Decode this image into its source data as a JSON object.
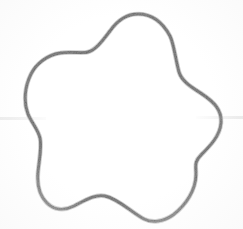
{
  "image": {
    "title": "Rounded five-pointed star outline",
    "description": "Scanned line drawing of a closed rounded star / flower-like blob outline",
    "width": 243,
    "height": 229,
    "background_color": "#ffffff",
    "stroke_color": "#8a8a8a",
    "stroke_color_light": "#a8a8a8",
    "stroke_width": 3
  },
  "shape": {
    "name": "rounded-star",
    "points": 5,
    "closed": true,
    "fill": "none",
    "center": {
      "x": 126,
      "y": 118
    },
    "outer_vertices": [
      {
        "label": "top",
        "x": 138,
        "y": 14
      },
      {
        "label": "right",
        "x": 222,
        "y": 108
      },
      {
        "label": "bottom-right",
        "x": 158,
        "y": 222
      },
      {
        "label": "bottom-left",
        "x": 57,
        "y": 205
      },
      {
        "label": "upper-left",
        "x": 39,
        "y": 57
      }
    ],
    "inner_vertices": [
      {
        "label": "upper-right-notch",
        "x": 179,
        "y": 72
      },
      {
        "label": "right-notch",
        "x": 196,
        "y": 172
      },
      {
        "label": "bottom-notch",
        "x": 105,
        "y": 196
      },
      {
        "label": "left-notch",
        "x": 38,
        "y": 131
      },
      {
        "label": "upper-left-notch",
        "x": 88,
        "y": 52
      }
    ],
    "path": "M 138 14 C 152 14 163 23 170 36 C 174 44 176 62 179 72 C 182 82 193 88 202 94 C 214 102 222 110 221 123 C 220 136 210 146 201 155 C 194 162 196 166 196 174 C 196 190 186 205 173 215 C 163 222 152 223 144 219 C 132 213 119 199 105 196 C 94 194 84 201 74 206 C 64 211 54 210 47 203 C 39 195 37 183 38 172 C 39 161 42 147 40 138 C 38 129 31 122 28 114 C 23 101 25 86 31 74 C 36 64 47 55 60 53 C 71 51 82 54 88 52 C 96 50 103 40 110 31 C 117 21 127 14 138 14 Z"
  },
  "artifacts": {
    "scan_streak_left": {
      "visible": true,
      "x": 0,
      "y": 117,
      "width": 46
    },
    "scan_streak_right": {
      "visible": true,
      "x": 196,
      "y": 116,
      "width": 47
    }
  }
}
